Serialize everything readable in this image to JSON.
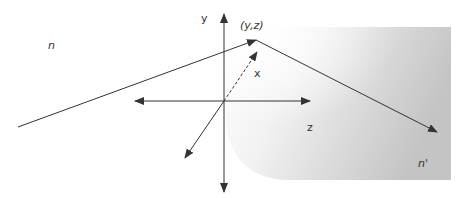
{
  "diagram": {
    "labels": {
      "n": "n",
      "n_prime": "n'",
      "point": "(y,z)",
      "axis_x": "x",
      "axis_y": "y",
      "axis_z": "z"
    },
    "colors": {
      "line": "#333333",
      "surface_light": "#ffffff",
      "surface_dark": "#c8c8c8"
    }
  }
}
